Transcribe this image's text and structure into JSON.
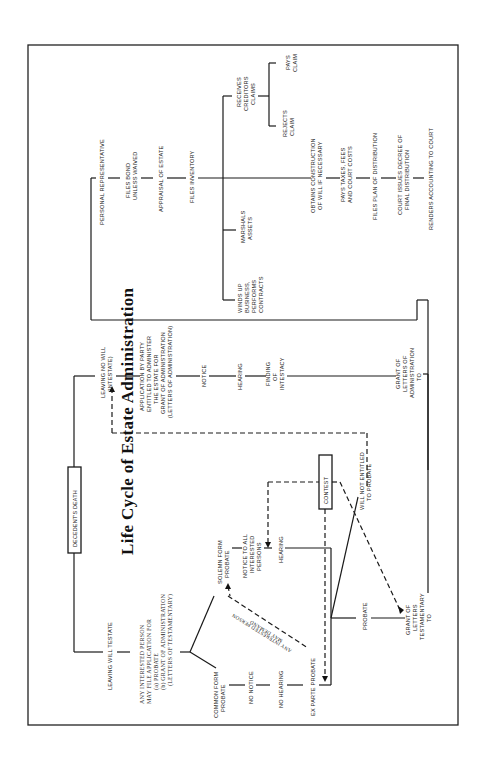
{
  "title": "Life Cycle of Estate Administration",
  "start": "DECEDENT'S DEATH",
  "testate": {
    "label": "LEAVING WILL TESTATE",
    "application": [
      "ANY INTERESTED PERSON",
      "MAY FILE APPLICATION FOR",
      "(a) PROBATE",
      "(b) GRANT OF ADMINISTRATION",
      "(LETTERS OF TESTAMENTARY)"
    ],
    "common_form": [
      "COMMON FORM",
      "PROBATE"
    ],
    "no_notice": "NO NOTICE",
    "no_hearing": "NO HEARING",
    "ex_parte": "EX PARTE PROBATE",
    "solemn_form": [
      "SOLEMN FORM",
      "PROBATE"
    ],
    "notice_all": [
      "NOTICE TO ALL",
      "INTERESTED",
      "PERSONS"
    ],
    "hearing": "HEARING",
    "demand": [
      "ANY INTERESTED PERSON",
      "MAY DEMAND"
    ],
    "contest": "CONTEST",
    "will_not_entitled": [
      "WILL NOT ENTITLED",
      "TO PROBATE"
    ],
    "probate": "PROBATE",
    "grant_testamentary": [
      "GRANT OF",
      "LETTERS",
      "TESTAMENTARY",
      "TO"
    ]
  },
  "intestate": {
    "label": [
      "LEAVING NO WILL",
      "(INTESTATE)"
    ],
    "application": [
      "APPLICATION BY PARTY",
      "ENTITLED TO ADMINISTER",
      "THE ESTATE FOR",
      "GRANT OF ADMINISTRATION",
      "(LETTERS OF ADMINISTRATION)"
    ],
    "notice": "NOTICE",
    "hearing": "HEARING",
    "finding": [
      "FINDING",
      "OF",
      "INTESTACY"
    ],
    "grant_administration": [
      "GRANT OF",
      "LETTERS OF",
      "ADMINISTRATION",
      "TO"
    ]
  },
  "representative": {
    "label": "PERSONAL REPRESENTATIVE",
    "files_bond": [
      "FILES BOND",
      "UNLESS WAIVED"
    ],
    "appraisal": "APPRAISAL OF ESTATE",
    "files_inventory": "FILES INVENTORY",
    "winds_up": [
      "WINDS UP",
      "BUSINESS,",
      "PERFORMS",
      "CONTRACTS"
    ],
    "marshals": [
      "MARSHALS",
      "ASSETS"
    ],
    "receives_claims": [
      "RECEIVES",
      "CREDITORS",
      "CLAIMS"
    ],
    "rejects_claim": [
      "REJECTS",
      "CLAIM"
    ],
    "pays_claim": [
      "PAYS",
      "CLAIM"
    ],
    "construction": [
      "OBTAINS CONSTRUCTION",
      "OF WILL IF NECESSARY"
    ],
    "pays_taxes": [
      "PAYS TAXES, FEES",
      "AND COURT COSTS"
    ],
    "plan": "FILES PLAN OF DISTRIBUTION",
    "decree": [
      "COURT ISSUES DECREE OF",
      "FINAL DISTRIBUTION"
    ],
    "accounting": "RENDERS ACCOUNTING TO COURT"
  }
}
